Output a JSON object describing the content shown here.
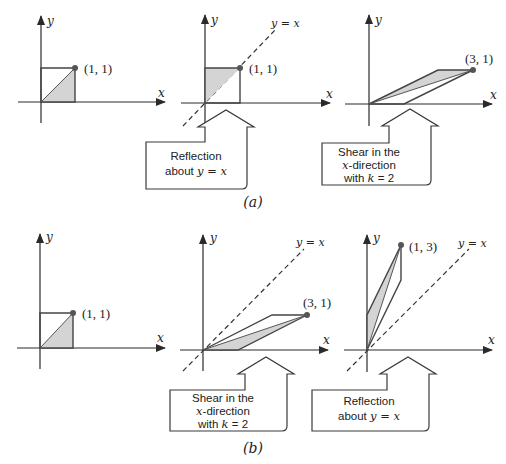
{
  "figure": {
    "colors": {
      "stroke": "#3a3a3a",
      "fill": "#d4d4d4",
      "point": "#555555",
      "text": "#222222"
    },
    "axis_label_x": "x",
    "axis_label_y": "y",
    "diagonal_label": "y = x",
    "parts": [
      {
        "id": "a",
        "caption": "(a)",
        "panels": [
          {
            "id": "a1",
            "point_label": "(1, 1)",
            "shape": "unit-square",
            "dashed_diagonal": false
          },
          {
            "id": "a2",
            "point_label": "(1, 1)",
            "shape": "unit-square-reflected",
            "dashed_diagonal": true
          },
          {
            "id": "a3",
            "point_label": "(3, 1)",
            "shape": "sheared-x-k2",
            "dashed_diagonal": false
          }
        ],
        "callouts": [
          {
            "line1": "Reflection",
            "line2_pre": "about ",
            "line2_math": "y = x",
            "line3": ""
          },
          {
            "line1": "Shear in the",
            "line2_math": "x",
            "line2_post": "-direction",
            "line3_pre": "with ",
            "line3_math": "k",
            "line3_post": " = 2"
          }
        ]
      },
      {
        "id": "b",
        "caption": "(b)",
        "panels": [
          {
            "id": "b1",
            "point_label": "(1, 1)",
            "shape": "unit-square",
            "dashed_diagonal": false
          },
          {
            "id": "b2",
            "point_label": "(3, 1)",
            "shape": "sheared-x-k2",
            "dashed_diagonal": true
          },
          {
            "id": "b3",
            "point_label": "(1, 3)",
            "shape": "sheared-then-reflected",
            "dashed_diagonal": true
          }
        ],
        "callouts": [
          {
            "line1": "Shear in the",
            "line2_math": "x",
            "line2_post": "-direction",
            "line3_pre": "with ",
            "line3_math": "k",
            "line3_post": " = 2"
          },
          {
            "line1": "Reflection",
            "line2_pre": "about ",
            "line2_math": "y = x",
            "line3": ""
          }
        ]
      }
    ]
  }
}
